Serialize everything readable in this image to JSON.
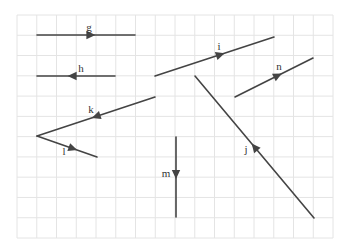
{
  "grid": {
    "x0": 17,
    "y0": 15,
    "x1": 333,
    "y1": 238,
    "cols": 16,
    "rows": 11,
    "color": "#e4e4e4"
  },
  "style": {
    "line_color": "#444444",
    "line_width": 1.6
  },
  "vectors": [
    {
      "name": "g",
      "from": [
        37,
        35
      ],
      "to": [
        135,
        35
      ],
      "arrow_at": 0.55,
      "label_pos": [
        89,
        31
      ]
    },
    {
      "name": "h",
      "from": [
        115,
        76
      ],
      "to": [
        37,
        76
      ],
      "arrow_at": 0.55,
      "label_pos": [
        81,
        72
      ]
    },
    {
      "name": "i",
      "from": [
        155,
        76
      ],
      "to": [
        274,
        37
      ],
      "arrow_at": 0.55,
      "label_pos": [
        219,
        50
      ]
    },
    {
      "name": "n",
      "from": [
        235,
        97
      ],
      "to": [
        313,
        58
      ],
      "arrow_at": 0.55,
      "label_pos": [
        279,
        70
      ]
    },
    {
      "name": "k",
      "from": [
        155,
        97
      ],
      "to": [
        37,
        136
      ],
      "arrow_at": 0.5,
      "label_pos": [
        91,
        113
      ]
    },
    {
      "name": "l",
      "from": [
        37,
        136
      ],
      "to": [
        97,
        157
      ],
      "arrow_at": 0.6,
      "label_pos": [
        64,
        155
      ]
    },
    {
      "name": "m",
      "from": [
        176,
        137
      ],
      "to": [
        176,
        217
      ],
      "arrow_at": 0.47,
      "label_pos": [
        166,
        177
      ]
    },
    {
      "name": "j",
      "from": [
        314,
        218
      ],
      "to": [
        195,
        76
      ],
      "arrow_at": 0.5,
      "label_pos": [
        246,
        153
      ]
    }
  ]
}
